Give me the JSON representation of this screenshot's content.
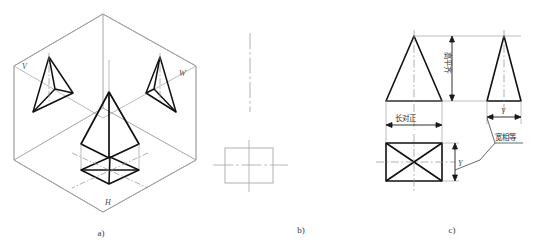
{
  "figure": {
    "title_captions": [
      {
        "id": "a",
        "label": "a)"
      },
      {
        "id": "b",
        "label": "b)"
      },
      {
        "id": "c",
        "label": "c)"
      }
    ],
    "panel_a": {
      "name": "isometric-projection-box",
      "plane_labels": [
        {
          "key": "V",
          "label": "V"
        },
        {
          "key": "W",
          "label": "W"
        },
        {
          "key": "H",
          "label": "H"
        }
      ]
    },
    "panel_b": {
      "name": "unfolded-planes-outline"
    },
    "panel_c": {
      "name": "three-view-orthographic-drawing",
      "annotations": [
        {
          "key": "length_align",
          "label": "长对正",
          "orientation": "horizontal"
        },
        {
          "key": "height_level",
          "label": "高平齐",
          "orientation": "vertical"
        },
        {
          "key": "width_equal",
          "label": "宽相等",
          "orientation": "horizontal"
        }
      ],
      "dimension_labels": [
        {
          "key": "y_side",
          "label": "Y"
        },
        {
          "key": "y_top",
          "label": "Y"
        }
      ]
    }
  },
  "colors": {
    "object_line": "#111111",
    "thin_line": "#8a8a8a",
    "center_line": "#7a7a7a",
    "faint_line": "#b4b4b4",
    "text": "#2c2c2c"
  }
}
